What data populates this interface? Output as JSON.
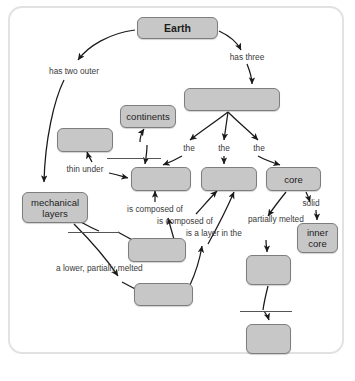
{
  "diagram": {
    "title_node": "Earth",
    "nodes": [
      {
        "id": "earth",
        "label": "Earth",
        "x": 137,
        "y": 17,
        "w": 81,
        "h": 22,
        "bold": true
      },
      {
        "id": "three-layers",
        "label": "",
        "x": 184,
        "y": 88,
        "w": 96,
        "h": 23,
        "bold": false
      },
      {
        "id": "continents",
        "label": "continents",
        "x": 120,
        "y": 105,
        "w": 56,
        "h": 23,
        "bold": false
      },
      {
        "id": "outer-left",
        "label": "",
        "x": 57,
        "y": 128,
        "w": 56,
        "h": 24,
        "bold": false
      },
      {
        "id": "crust",
        "label": "",
        "x": 131,
        "y": 167,
        "w": 60,
        "h": 24,
        "bold": false
      },
      {
        "id": "mantle",
        "label": "",
        "x": 201,
        "y": 167,
        "w": 56,
        "h": 24,
        "bold": false
      },
      {
        "id": "core",
        "label": "core",
        "x": 266,
        "y": 167,
        "w": 55,
        "h": 24,
        "bold": false
      },
      {
        "id": "mechanical-layers",
        "label": "mechanical layers",
        "x": 22,
        "y": 192,
        "w": 66,
        "h": 31,
        "bold": false
      },
      {
        "id": "inner-core",
        "label": "inner core",
        "x": 297,
        "y": 223,
        "w": 41,
        "h": 30,
        "bold": false
      },
      {
        "id": "outer-core",
        "label": "",
        "x": 246,
        "y": 255,
        "w": 45,
        "h": 30,
        "bold": false
      },
      {
        "id": "middle-layer",
        "label": "",
        "x": 128,
        "y": 238,
        "w": 58,
        "h": 24,
        "bold": false
      },
      {
        "id": "lower-layer",
        "label": "",
        "x": 134,
        "y": 283,
        "w": 59,
        "h": 23,
        "bold": false
      },
      {
        "id": "bottom-right",
        "label": "",
        "x": 246,
        "y": 324,
        "w": 45,
        "h": 30,
        "bold": false
      }
    ],
    "labels": [
      {
        "id": "has-two-outer",
        "text": "has two outer",
        "x": 43,
        "y": 66,
        "w": 62
      },
      {
        "id": "has-three",
        "text": "has three",
        "x": 226,
        "y": 52,
        "w": 42
      },
      {
        "id": "the-1",
        "text": "the",
        "x": 180,
        "y": 143,
        "w": 18
      },
      {
        "id": "the-2",
        "text": "the",
        "x": 215,
        "y": 143,
        "w": 18
      },
      {
        "id": "the-3",
        "text": "the",
        "x": 250,
        "y": 143,
        "w": 18
      },
      {
        "id": "thin-under",
        "text": "thin under",
        "x": 61,
        "y": 164,
        "w": 48
      },
      {
        "id": "is-composed-of-1",
        "text": "is composed of",
        "x": 120,
        "y": 204,
        "w": 70
      },
      {
        "id": "is-composed-of-2",
        "text": "is composed of",
        "x": 150,
        "y": 216,
        "w": 70
      },
      {
        "id": "solid",
        "text": "solid",
        "x": 298,
        "y": 198,
        "w": 26
      },
      {
        "id": "partially-melted",
        "text": "partially melted",
        "x": 248,
        "y": 214,
        "w": 40
      },
      {
        "id": "is-a-layer-in-the",
        "text": "is a layer in the",
        "x": 186,
        "y": 228,
        "w": 42
      },
      {
        "id": "a-lower-partially-melted",
        "text": "a lower, partially melted",
        "x": 56,
        "y": 263,
        "w": 82
      }
    ],
    "rules": [
      {
        "id": "rule-crust-top",
        "x": 107,
        "y": 158,
        "w": 54
      },
      {
        "id": "rule-middle-layer",
        "x": 68,
        "y": 232,
        "w": 52
      },
      {
        "id": "rule-bottom-right",
        "x": 240,
        "y": 311,
        "w": 52
      }
    ],
    "colors": {
      "node_fill": "#c7c7c7",
      "node_border": "#7d7d7d",
      "frame_border": "#e2e2e2",
      "label_text": "#3a3a3a",
      "arrow": "#1a1a1a"
    }
  }
}
